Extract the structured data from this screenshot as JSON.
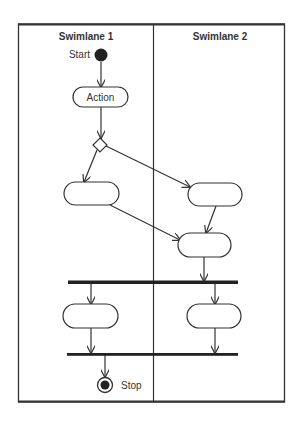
{
  "diagram": {
    "type": "UML activity diagram with swimlanes",
    "swimlanes": [
      {
        "title": "Swimlane 1"
      },
      {
        "title": "Swimlane 2"
      }
    ],
    "start_label": "Start",
    "stop_label": "Stop",
    "action_label": "Action",
    "nodes": [
      {
        "id": "start",
        "kind": "initial",
        "label": "Start",
        "lane": 1
      },
      {
        "id": "action",
        "kind": "action",
        "label": "Action",
        "lane": 1
      },
      {
        "id": "decision",
        "kind": "decision",
        "label": "",
        "lane": 1
      },
      {
        "id": "a1",
        "kind": "action",
        "label": "",
        "lane": 1
      },
      {
        "id": "a2",
        "kind": "action",
        "label": "",
        "lane": 2
      },
      {
        "id": "a3",
        "kind": "action",
        "label": "",
        "lane": 2
      },
      {
        "id": "fork",
        "kind": "fork",
        "label": ""
      },
      {
        "id": "a4",
        "kind": "action",
        "label": "",
        "lane": 1
      },
      {
        "id": "a5",
        "kind": "action",
        "label": "",
        "lane": 2
      },
      {
        "id": "join",
        "kind": "join",
        "label": ""
      },
      {
        "id": "stop",
        "kind": "final",
        "label": "Stop",
        "lane": 1
      }
    ],
    "edges": [
      [
        "start",
        "action"
      ],
      [
        "action",
        "decision"
      ],
      [
        "decision",
        "a1"
      ],
      [
        "decision",
        "a2"
      ],
      [
        "a1",
        "a3"
      ],
      [
        "a2",
        "a3"
      ],
      [
        "a3",
        "fork"
      ],
      [
        "fork",
        "a4"
      ],
      [
        "fork",
        "a5"
      ],
      [
        "a4",
        "join"
      ],
      [
        "a5",
        "join"
      ],
      [
        "join",
        "stop"
      ]
    ],
    "colors": {
      "line": "#333333",
      "fill": "#ffffff",
      "dark": "#222222"
    }
  }
}
